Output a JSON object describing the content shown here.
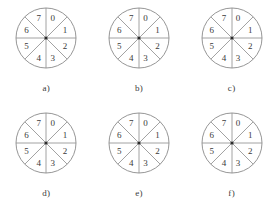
{
  "figure": {
    "background_color": "#ffffff",
    "stroke_color": "#8a8a8a",
    "text_color": "#3a3a3a",
    "center_dot_color": "#2b2b2b",
    "circle_diameter_px": 60,
    "sector_count": 8,
    "panels": [
      {
        "caption": "a)",
        "sectors": [
          {
            "index": 0,
            "label": "0",
            "x_pct": 60,
            "y_pct": 19
          },
          {
            "index": 1,
            "label": "1",
            "x_pct": 79,
            "y_pct": 38
          },
          {
            "index": 2,
            "label": "2",
            "x_pct": 79,
            "y_pct": 63
          },
          {
            "index": 3,
            "label": "3",
            "x_pct": 60,
            "y_pct": 82
          },
          {
            "index": 4,
            "label": "4",
            "x_pct": 38,
            "y_pct": 82
          },
          {
            "index": 5,
            "label": "5",
            "x_pct": 19,
            "y_pct": 63
          },
          {
            "index": 6,
            "label": "6",
            "x_pct": 19,
            "y_pct": 38
          },
          {
            "index": 7,
            "label": "7",
            "x_pct": 38,
            "y_pct": 19
          }
        ]
      },
      {
        "caption": "b)",
        "sectors": [
          {
            "index": 0,
            "label": "0",
            "x_pct": 60,
            "y_pct": 19
          },
          {
            "index": 1,
            "label": "1",
            "x_pct": 79,
            "y_pct": 38
          },
          {
            "index": 2,
            "label": "2",
            "x_pct": 79,
            "y_pct": 63
          },
          {
            "index": 3,
            "label": "3",
            "x_pct": 60,
            "y_pct": 82
          },
          {
            "index": 4,
            "label": "4",
            "x_pct": 38,
            "y_pct": 82
          },
          {
            "index": 5,
            "label": "5",
            "x_pct": 19,
            "y_pct": 63
          },
          {
            "index": 6,
            "label": "6",
            "x_pct": 19,
            "y_pct": 38
          },
          {
            "index": 7,
            "label": "7",
            "x_pct": 38,
            "y_pct": 19
          }
        ]
      },
      {
        "caption": "c)",
        "sectors": [
          {
            "index": 0,
            "label": "0",
            "x_pct": 60,
            "y_pct": 19
          },
          {
            "index": 1,
            "label": "1",
            "x_pct": 79,
            "y_pct": 38
          },
          {
            "index": 2,
            "label": "2",
            "x_pct": 79,
            "y_pct": 63
          },
          {
            "index": 3,
            "label": "3",
            "x_pct": 60,
            "y_pct": 82
          },
          {
            "index": 4,
            "label": "4",
            "x_pct": 38,
            "y_pct": 82
          },
          {
            "index": 5,
            "label": "5",
            "x_pct": 19,
            "y_pct": 63
          },
          {
            "index": 6,
            "label": "6",
            "x_pct": 19,
            "y_pct": 38
          },
          {
            "index": 7,
            "label": "7",
            "x_pct": 38,
            "y_pct": 19
          }
        ]
      },
      {
        "caption": "d)",
        "sectors": [
          {
            "index": 0,
            "label": "0",
            "x_pct": 60,
            "y_pct": 19
          },
          {
            "index": 1,
            "label": "1",
            "x_pct": 79,
            "y_pct": 38
          },
          {
            "index": 2,
            "label": "2",
            "x_pct": 79,
            "y_pct": 63
          },
          {
            "index": 3,
            "label": "3",
            "x_pct": 60,
            "y_pct": 82
          },
          {
            "index": 4,
            "label": "4",
            "x_pct": 38,
            "y_pct": 82
          },
          {
            "index": 5,
            "label": "5",
            "x_pct": 19,
            "y_pct": 63
          },
          {
            "index": 6,
            "label": "6",
            "x_pct": 19,
            "y_pct": 38
          },
          {
            "index": 7,
            "label": "7",
            "x_pct": 38,
            "y_pct": 19
          }
        ]
      },
      {
        "caption": "e)",
        "sectors": [
          {
            "index": 0,
            "label": "0",
            "x_pct": 60,
            "y_pct": 19
          },
          {
            "index": 1,
            "label": "1",
            "x_pct": 79,
            "y_pct": 38
          },
          {
            "index": 2,
            "label": "2",
            "x_pct": 79,
            "y_pct": 63
          },
          {
            "index": 3,
            "label": "3",
            "x_pct": 60,
            "y_pct": 82
          },
          {
            "index": 4,
            "label": "4",
            "x_pct": 38,
            "y_pct": 82
          },
          {
            "index": 5,
            "label": "5",
            "x_pct": 19,
            "y_pct": 63
          },
          {
            "index": 6,
            "label": "6",
            "x_pct": 19,
            "y_pct": 38
          },
          {
            "index": 7,
            "label": "7",
            "x_pct": 38,
            "y_pct": 19
          }
        ]
      },
      {
        "caption": "f)",
        "sectors": [
          {
            "index": 0,
            "label": "0",
            "x_pct": 60,
            "y_pct": 19
          },
          {
            "index": 1,
            "label": "1",
            "x_pct": 79,
            "y_pct": 38
          },
          {
            "index": 2,
            "label": "2",
            "x_pct": 79,
            "y_pct": 63
          },
          {
            "index": 3,
            "label": "3",
            "x_pct": 60,
            "y_pct": 82
          },
          {
            "index": 4,
            "label": "4",
            "x_pct": 38,
            "y_pct": 82
          },
          {
            "index": 5,
            "label": "5",
            "x_pct": 19,
            "y_pct": 63
          },
          {
            "index": 6,
            "label": "6",
            "x_pct": 19,
            "y_pct": 38
          },
          {
            "index": 7,
            "label": "7",
            "x_pct": 38,
            "y_pct": 19
          }
        ]
      }
    ]
  }
}
